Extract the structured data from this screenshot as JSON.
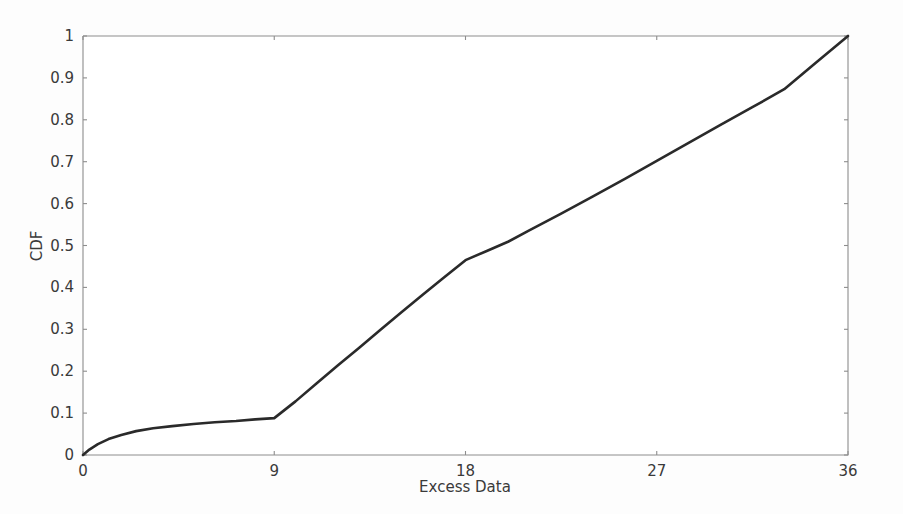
{
  "chart_data": {
    "type": "line",
    "title": "",
    "subtitle": "",
    "xlabel": "Excess Data",
    "ylabel": "CDF",
    "xlim": [
      0,
      36
    ],
    "ylim": [
      0,
      1
    ],
    "grid": false,
    "legend": null,
    "legend_position": "none",
    "line_color": "#2a2a2a",
    "axis_color": "#8d8d8d",
    "background_color": "#fdfdfd",
    "xticks": [
      0,
      9,
      18,
      27,
      36
    ],
    "xtick_labels": [
      "0",
      "9",
      "18",
      "27",
      "36"
    ],
    "yticks": [
      0,
      0.1,
      0.2,
      0.3,
      0.4,
      0.5,
      0.6,
      0.7,
      0.8,
      0.9,
      1
    ],
    "ytick_labels": [
      "0",
      "0.1",
      "0.2",
      "0.3",
      "0.4",
      "0.5",
      "0.6",
      "0.7",
      "0.8",
      "0.9",
      "1"
    ],
    "series": [
      {
        "name": "CDF",
        "x": [
          0,
          0.3,
          0.7,
          1.2,
          1.8,
          2.5,
          3.3,
          4.2,
          5.2,
          6.2,
          7.2,
          8.1,
          9.0,
          10.0,
          11.0,
          12.0,
          13.0,
          14.0,
          15.0,
          16.0,
          17.0,
          18.0,
          19.0,
          20.0,
          21.0,
          22.5,
          24.0,
          25.5,
          27.0,
          28.5,
          30.0,
          31.5,
          33.0,
          34.5,
          36.0
        ],
        "y": [
          0.0,
          0.013,
          0.026,
          0.038,
          0.048,
          0.057,
          0.064,
          0.069,
          0.074,
          0.078,
          0.081,
          0.085,
          0.088,
          0.128,
          0.171,
          0.214,
          0.256,
          0.299,
          0.341,
          0.383,
          0.424,
          0.465,
          0.487,
          0.509,
          0.536,
          0.576,
          0.617,
          0.659,
          0.702,
          0.745,
          0.788,
          0.83,
          0.873,
          0.937,
          1.0
        ]
      }
    ],
    "annotations": []
  },
  "axes_geometry": {
    "left_px": 83,
    "right_px": 848,
    "top_px": 36,
    "bottom_px": 455
  }
}
